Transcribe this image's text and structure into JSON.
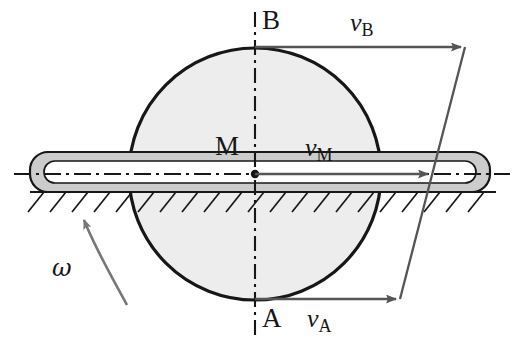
{
  "figure": {
    "type": "mechanics-kinematics-diagram",
    "background_color": "#ffffff",
    "ink_color": "#171717",
    "arrow_color": "#555555",
    "wheel_fill": "#ededed",
    "bar_fill": "#cccccc",
    "bar_inner_fill": "#ffffff"
  },
  "labels": {
    "point_b": "B",
    "point_a": "A",
    "point_m": "M",
    "omega": "ω",
    "v_b_symbol": "v",
    "v_b_sub": "B",
    "v_m_symbol": "v",
    "v_m_sub": "M",
    "v_a_symbol": "v",
    "v_a_sub": "A"
  },
  "geometry": {
    "wheel": {
      "cx": 255,
      "cy": 174,
      "r": 126
    },
    "bar": {
      "x": 30,
      "y": 152,
      "width": 460,
      "height": 40,
      "radius": 18
    },
    "bar_channel": {
      "x": 44,
      "y": 161,
      "width": 432,
      "height": 22,
      "radius": 11
    },
    "ground_line_y": 192,
    "axis_vertical": {
      "x": 255,
      "y_top": 12,
      "y_bottom": 336
    },
    "axis_horizontal_y": 174
  },
  "vectors": [
    {
      "name": "v_B",
      "point": "B",
      "tail_x": 255,
      "tail_y": 47,
      "tip_x": 465,
      "tip_y": 47,
      "length_px": 210
    },
    {
      "name": "v_M",
      "point": "M",
      "tail_x": 255,
      "tail_y": 174,
      "tip_x": 432,
      "tip_y": 174,
      "length_px": 177
    },
    {
      "name": "v_A",
      "point": "A",
      "tail_x": 255,
      "tail_y": 299,
      "tip_x": 400,
      "tip_y": 299,
      "length_px": 145
    }
  ],
  "tip_envelope": {
    "from_x": 465,
    "from_y": 47,
    "to_x": 400,
    "to_y": 299
  },
  "rotation_arrow": {
    "direction": "counterclockwise",
    "tail_x": 127,
    "tail_y": 305,
    "tip_x": 81,
    "tip_y": 214
  }
}
